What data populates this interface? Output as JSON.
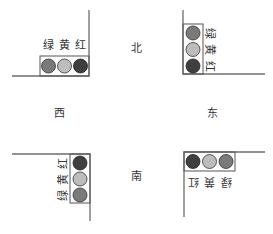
{
  "diagram": {
    "type": "traffic-light-intersection",
    "directions": {
      "north": "北",
      "south": "南",
      "west": "西",
      "east": "东"
    },
    "light_labels": {
      "green": "绿",
      "yellow": "黄",
      "red": "红"
    },
    "colors": {
      "line": "#6e6e6e",
      "box": "#555555",
      "green_light": "#7a7a7a",
      "yellow_light": "#bdbdbd",
      "red_light": "#3f3f3f"
    },
    "signals": [
      {
        "corner": "top-left",
        "orientation": "horizontal",
        "order": [
          "green",
          "yellow",
          "red"
        ]
      },
      {
        "corner": "top-right",
        "orientation": "vertical",
        "order": [
          "green",
          "yellow",
          "red"
        ]
      },
      {
        "corner": "bottom-left",
        "orientation": "vertical",
        "order": [
          "red",
          "yellow",
          "green"
        ]
      },
      {
        "corner": "bottom-right",
        "orientation": "horizontal",
        "order": [
          "red",
          "yellow",
          "green"
        ]
      }
    ]
  }
}
